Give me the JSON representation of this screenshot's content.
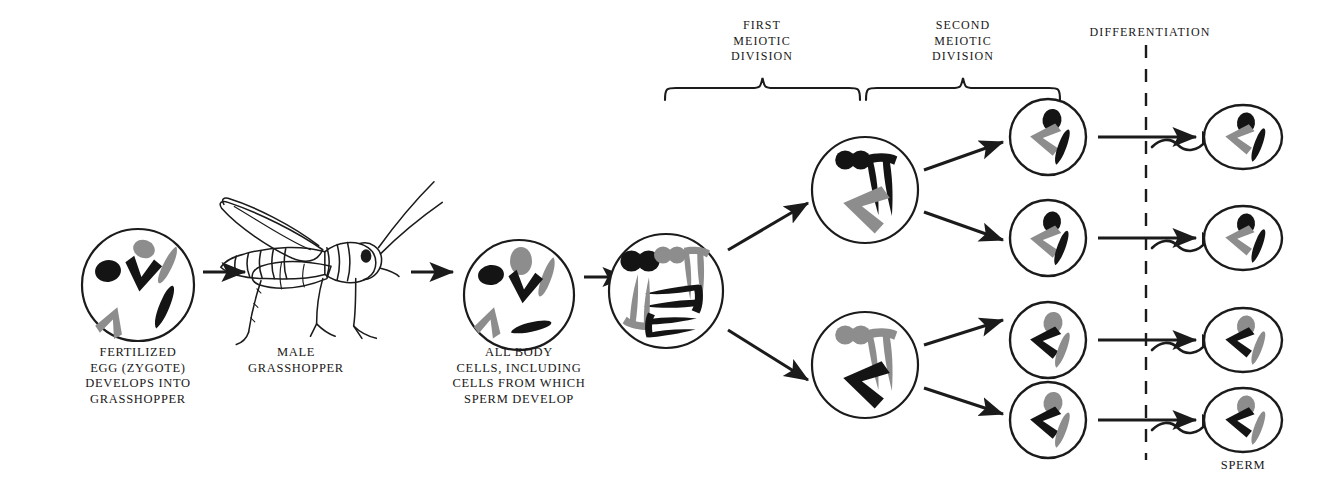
{
  "figure": {
    "colors": {
      "ink": "#1a1a1a",
      "chromosome_black": "#141414",
      "chromosome_gray": "#8d8d8d",
      "background": "#ffffff"
    }
  },
  "headers": [
    {
      "id": "first-meiotic-division",
      "text": "FIRST\nMEIOTIC\nDIVISION",
      "x": 762,
      "y": 18,
      "brace": {
        "x1": 665,
        "x2": 860,
        "y": 86
      }
    },
    {
      "id": "second-meiotic-division",
      "text": "SECOND\nMEIOTIC\nDIVISION",
      "x": 963,
      "y": 18,
      "brace": {
        "x1": 866,
        "x2": 1060,
        "y": 86
      }
    },
    {
      "id": "differentiation",
      "text": "DIFFERENTIATION",
      "x": 1150,
      "y": 25,
      "divider": {
        "x": 1146,
        "y1": 45,
        "y2": 460,
        "style": "dashed"
      }
    }
  ],
  "labels": [
    {
      "id": "fertilized-egg",
      "text": "FERTILIZED\nEGG  (ZYGOTE)\nDEVELOPS  INTO\nGRASSHOPPER",
      "x": 138,
      "y": 345
    },
    {
      "id": "male-grasshopper",
      "text": "MALE\nGRASSHOPPER",
      "x": 296,
      "y": 345
    },
    {
      "id": "all-body-cells",
      "text": "ALL  BODY\nCELLS,  INCLUDING\nCELLS FROM  WHICH\nSPERM  DEVELOP",
      "x": 519,
      "y": 345
    },
    {
      "id": "sperm",
      "text": "SPERM",
      "x": 1243,
      "y": 458
    }
  ],
  "cells": [
    {
      "id": "zygote-cell",
      "name": "fertilized-egg-cell",
      "cx": 138,
      "cy": 285,
      "r": 56,
      "stage": "zygote",
      "chromosome_count": 6,
      "note": "diploid set, three black and three gray chromosomes"
    },
    {
      "id": "body-cell",
      "name": "body-cell",
      "cx": 519,
      "cy": 295,
      "r": 55,
      "stage": "somatic-cell",
      "chromosome_count": 6,
      "note": "diploid set before duplication"
    },
    {
      "id": "spermatocyte",
      "name": "primary-spermatocyte-cell",
      "cx": 666,
      "cy": 291,
      "r": 57,
      "stage": "duplicated-chromosomes",
      "chromosome_count": 6,
      "note": "each chromosome duplicated into paired chromatids"
    },
    {
      "id": "meiosis1-upper",
      "name": "secondary-spermatocyte-upper",
      "cx": 865,
      "cy": 190,
      "r": 53,
      "stage": "after-first-meiotic-division",
      "chromosome_count": 3
    },
    {
      "id": "meiosis1-lower",
      "name": "secondary-spermatocyte-lower",
      "cx": 865,
      "cy": 365,
      "r": 53,
      "stage": "after-first-meiotic-division",
      "chromosome_count": 3
    },
    {
      "id": "spermatid-1",
      "name": "spermatid-row-1",
      "cx": 1048,
      "cy": 137,
      "r": 38,
      "stage": "after-second-meiotic-division",
      "chromosome_count": 3
    },
    {
      "id": "spermatid-2",
      "name": "spermatid-row-2",
      "cx": 1048,
      "cy": 238,
      "r": 38,
      "stage": "after-second-meiotic-division",
      "chromosome_count": 2
    },
    {
      "id": "spermatid-3",
      "name": "spermatid-row-3",
      "cx": 1048,
      "cy": 340,
      "r": 38,
      "stage": "after-second-meiotic-division",
      "chromosome_count": 3
    },
    {
      "id": "spermatid-4",
      "name": "spermatid-row-4",
      "cx": 1048,
      "cy": 420,
      "r": 38,
      "stage": "after-second-meiotic-division",
      "chromosome_count": 3
    }
  ],
  "sperm": [
    {
      "id": "sperm-1",
      "cx": 1243,
      "cy": 137,
      "rx": 39,
      "ry": 32
    },
    {
      "id": "sperm-2",
      "cx": 1243,
      "cy": 238,
      "rx": 39,
      "ry": 32
    },
    {
      "id": "sperm-3",
      "cx": 1243,
      "cy": 340,
      "rx": 39,
      "ry": 32
    },
    {
      "id": "sperm-4",
      "cx": 1243,
      "cy": 420,
      "rx": 39,
      "ry": 32
    }
  ],
  "arrows": [
    {
      "id": "arrow-zygote-to-grasshopper",
      "x1": 203,
      "y1": 272,
      "x2": 245,
      "y2": 272
    },
    {
      "id": "arrow-grasshopper-to-bodycell",
      "x1": 411,
      "y1": 272,
      "x2": 453,
      "y2": 272
    },
    {
      "id": "arrow-bodycell-to-spermatocyte",
      "x1": 584,
      "y1": 277,
      "x2": 626,
      "y2": 277
    },
    {
      "id": "arrow-meiosis1-upper",
      "x1": 728,
      "y1": 250,
      "x2": 808,
      "y2": 203
    },
    {
      "id": "arrow-meiosis1-lower",
      "x1": 728,
      "y1": 330,
      "x2": 808,
      "y2": 380
    },
    {
      "id": "arrow-meiosis2-a",
      "x1": 924,
      "y1": 170,
      "x2": 1003,
      "y2": 142
    },
    {
      "id": "arrow-meiosis2-b",
      "x1": 924,
      "y1": 212,
      "x2": 1003,
      "y2": 240
    },
    {
      "id": "arrow-meiosis2-c",
      "x1": 924,
      "y1": 345,
      "x2": 1003,
      "y2": 320
    },
    {
      "id": "arrow-meiosis2-d",
      "x1": 924,
      "y1": 388,
      "x2": 1003,
      "y2": 414
    },
    {
      "id": "arrow-differentiation-1",
      "x1": 1098,
      "y1": 137,
      "x2": 1196,
      "y2": 137
    },
    {
      "id": "arrow-differentiation-2",
      "x1": 1098,
      "y1": 238,
      "x2": 1196,
      "y2": 238
    },
    {
      "id": "arrow-differentiation-3",
      "x1": 1098,
      "y1": 340,
      "x2": 1196,
      "y2": 340
    },
    {
      "id": "arrow-differentiation-4",
      "x1": 1098,
      "y1": 420,
      "x2": 1196,
      "y2": 420
    }
  ],
  "illustration": {
    "id": "male-grasshopper-drawing",
    "cx": 296,
    "cy": 258,
    "style": "line-art-side-view-facing-right"
  }
}
